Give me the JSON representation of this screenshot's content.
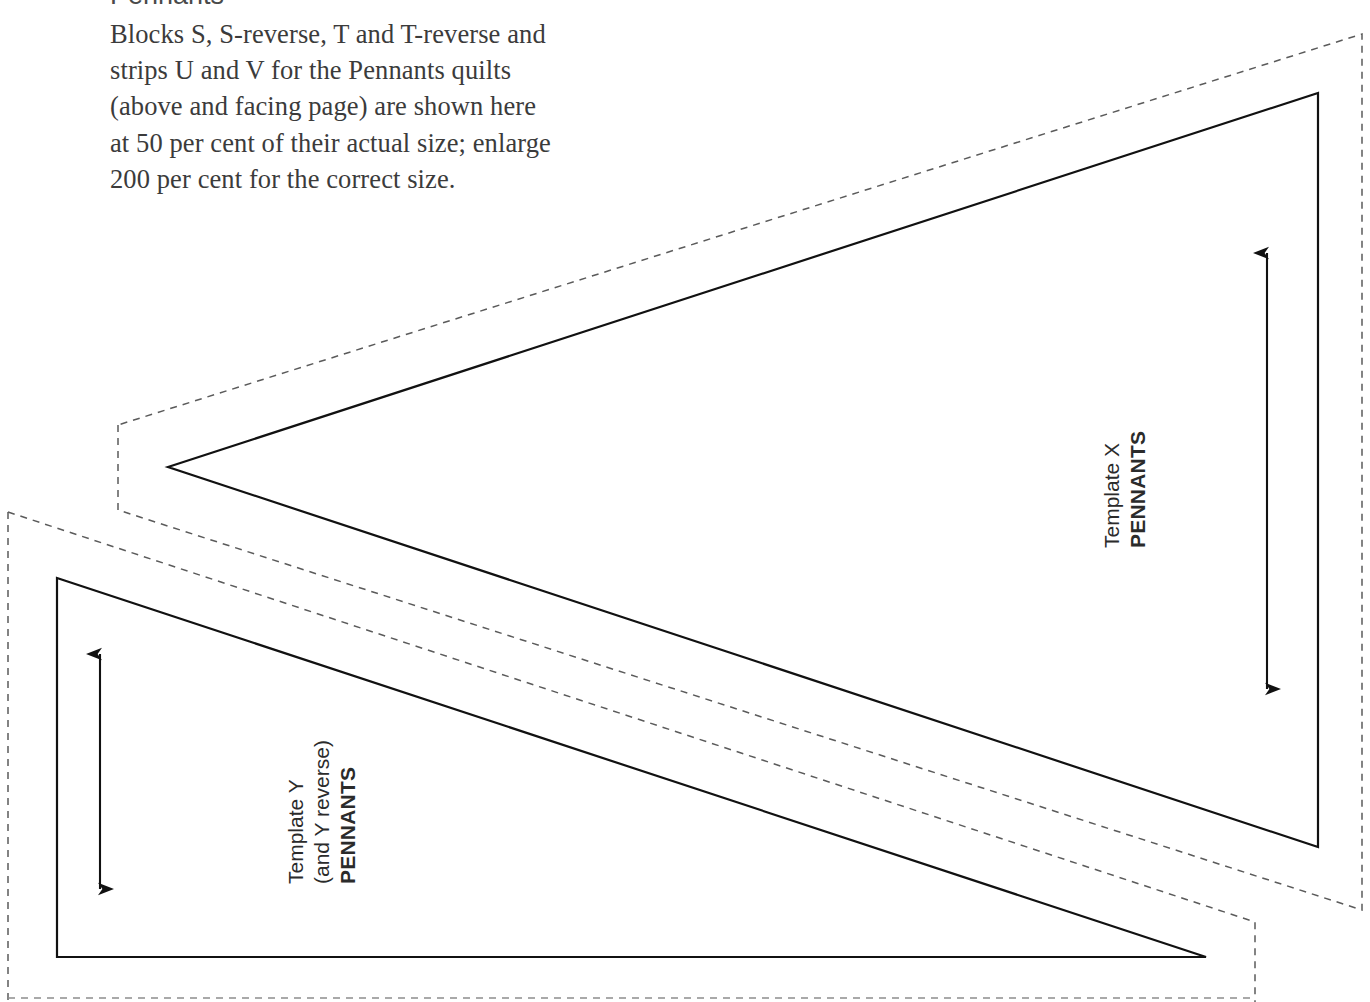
{
  "page": {
    "width": 1370,
    "height": 1002,
    "background": "#ffffff",
    "ink": "#1a1a1a",
    "text_color": "#3b3b3b",
    "heading_color": "#4a4a4a"
  },
  "instructions": {
    "heading": "Pennants",
    "lines": [
      "Blocks S, S-reverse, T and T-reverse and",
      "strips U and V for the Pennants quilts",
      "(above and facing page) are shown here",
      "at 50 per cent of their actual size; enlarge",
      "200 per cent for the correct size."
    ]
  },
  "templates": [
    {
      "id": "template-x",
      "label_lines": [
        "Template X",
        "PENNANTS"
      ],
      "bold_line_index": 1,
      "grain_arrow": {
        "x": 1267,
        "y_top": 237,
        "y_bottom": 705,
        "double_headed": true
      },
      "cut_outline_style": "dashed",
      "sew_outline_style": "solid",
      "sew_points": "168,467 1318,93 1318,847",
      "cut_points": "118,425 118,510 1362,34 1362,910"
    },
    {
      "id": "template-y",
      "label_lines": [
        "Template Y",
        "(and Y reverse)",
        "PENNANTS"
      ],
      "bold_line_index": 2,
      "grain_arrow": {
        "x": 100,
        "y_top": 638,
        "y_bottom": 905,
        "double_headed": true
      },
      "cut_outline_style": "dashed",
      "sew_outline_style": "solid",
      "sew_points": "57,578 1206,957 57,957",
      "cut_points": "8,512 1255,922 1255,1002 8,1002"
    }
  ],
  "line_styles": {
    "solid_width": 2.2,
    "dashed_width": 1.5,
    "dash_pattern": "7,6"
  }
}
